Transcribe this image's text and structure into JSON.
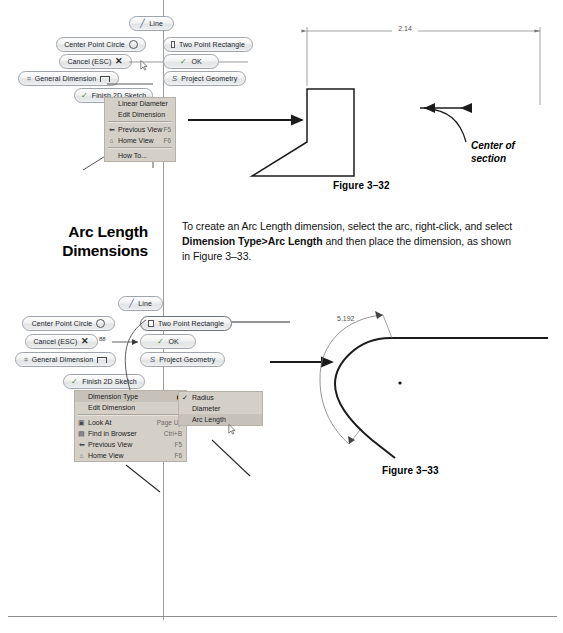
{
  "page": {
    "background": "#ffffff",
    "rule_color": "#9a9a9a"
  },
  "section": {
    "heading_line1": "Arc Length",
    "heading_line2": "Dimensions",
    "body_part1": "To create an Arc Length dimension, select the arc, right-click, and select ",
    "body_bold": "Dimension Type>Arc Length",
    "body_part2": " and then place the dimension, as shown in Figure 3–33."
  },
  "figure_top": {
    "caption": "Figure 3–32",
    "dimension_value": "2.14",
    "annotation": "Center of\nsection",
    "annotation_line1": "Center of",
    "annotation_line2": "section",
    "marking_menu": {
      "buttons": [
        {
          "id": "line",
          "label": "Line",
          "icon": "line-icon"
        },
        {
          "id": "center-point-circle",
          "label": "Center Point Circle",
          "icon": "circle-icon"
        },
        {
          "id": "two-point-rectangle",
          "label": "Two Point Rectangle",
          "icon": "rectangle-icon"
        },
        {
          "id": "cancel-esc",
          "label": "Cancel (ESC)",
          "icon": "cross-icon"
        },
        {
          "id": "ok",
          "label": "OK",
          "icon": "check-icon"
        },
        {
          "id": "general-dimension",
          "label": "General Dimension",
          "icon": "dimension-icon"
        },
        {
          "id": "project-geometry",
          "label": "Project Geometry",
          "icon": "project-geometry-icon"
        },
        {
          "id": "finish-2d-sketch",
          "label": "Finish 2D Sketch",
          "icon": "check-icon"
        }
      ]
    },
    "context_menu": {
      "items": [
        {
          "label": "Linear Diameter",
          "accel": "",
          "icon": "",
          "underline": "L"
        },
        {
          "label": "Edit Dimension",
          "accel": "",
          "icon": "",
          "underline": "E"
        },
        {
          "label": "Previous View",
          "accel": "F5",
          "icon": "previous-view-icon",
          "underline": "P"
        },
        {
          "label": "Home View",
          "accel": "F6",
          "icon": "home-view-icon",
          "underline": "H"
        },
        {
          "label": "How To...",
          "accel": "",
          "icon": "",
          "underline": "H"
        }
      ]
    }
  },
  "figure_bottom": {
    "caption": "Figure 3–33",
    "dimension_value": "5.192",
    "angle_value": "88",
    "marking_menu": {
      "buttons": [
        {
          "id": "line",
          "label": "Line",
          "icon": "line-icon"
        },
        {
          "id": "center-point-circle",
          "label": "Center Point Circle",
          "icon": "circle-icon"
        },
        {
          "id": "two-point-rectangle",
          "label": "Two Point Rectangle",
          "icon": "rectangle-icon"
        },
        {
          "id": "cancel-esc",
          "label": "Cancel (ESC)",
          "icon": "cross-icon"
        },
        {
          "id": "ok",
          "label": "OK",
          "icon": "check-icon"
        },
        {
          "id": "general-dimension",
          "label": "General Dimension",
          "icon": "dimension-icon"
        },
        {
          "id": "project-geometry",
          "label": "Project Geometry",
          "icon": "project-geometry-icon"
        },
        {
          "id": "finish-2d-sketch",
          "label": "Finish 2D Sketch",
          "icon": "check-icon"
        }
      ]
    },
    "context_menu": {
      "items": [
        {
          "label": "Dimension Type",
          "accel": "",
          "arrow": "▶",
          "icon": "",
          "selected": true
        },
        {
          "label": "Edit Dimension",
          "accel": "",
          "arrow": "",
          "icon": ""
        },
        {
          "label": "Look At",
          "accel": "Page Up",
          "arrow": "",
          "icon": "look-at-icon"
        },
        {
          "label": "Find in Browser",
          "accel": "Ctrl+B",
          "arrow": "",
          "icon": "find-in-browser-icon"
        },
        {
          "label": "Previous View",
          "accel": "F5",
          "arrow": "",
          "icon": "previous-view-icon"
        },
        {
          "label": "Home View",
          "accel": "F6",
          "arrow": "",
          "icon": "home-view-icon"
        }
      ]
    },
    "submenu": {
      "items": [
        {
          "label": "Radius",
          "checked": true,
          "selected": false
        },
        {
          "label": "Diameter",
          "checked": false,
          "selected": false
        },
        {
          "label": "Arc Length",
          "checked": false,
          "selected": true
        }
      ]
    }
  }
}
